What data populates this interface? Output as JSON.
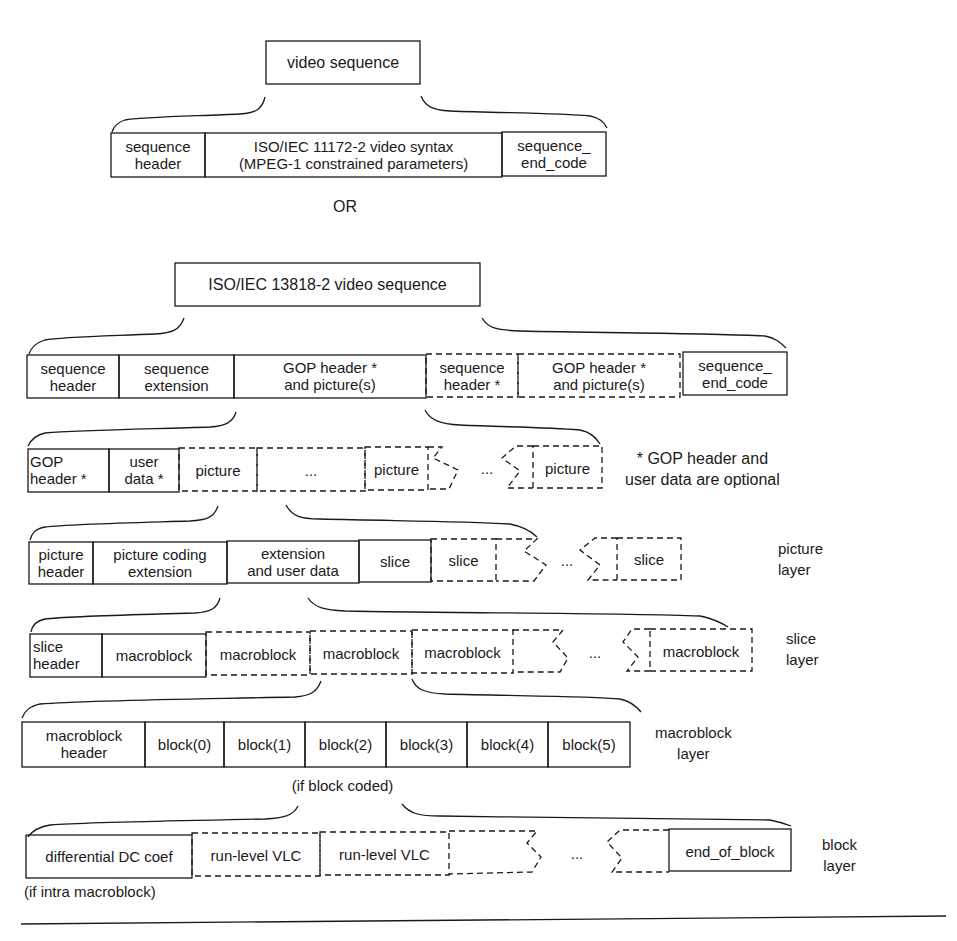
{
  "diagram": {
    "title_box_mpeg1": "video sequence",
    "mpeg1_row": {
      "cells": [
        {
          "label": [
            "sequence",
            "header"
          ],
          "style": "solid"
        },
        {
          "label": [
            "ISO/IEC 11172-2 video syntax",
            "(MPEG-1 constrained parameters)"
          ],
          "style": "solid"
        },
        {
          "label": [
            "sequence_",
            "end_code"
          ],
          "style": "solid"
        }
      ]
    },
    "or_label": "OR",
    "title_box_mpeg2": "ISO/IEC 13818-2 video sequence",
    "sequence_row": {
      "cells": [
        {
          "label": [
            "sequence",
            "header"
          ],
          "style": "solid"
        },
        {
          "label": [
            "sequence",
            "extension"
          ],
          "style": "solid"
        },
        {
          "label": [
            "GOP header *",
            "and picture(s)"
          ],
          "style": "solid"
        },
        {
          "label": [
            "sequence",
            "header *"
          ],
          "style": "dashed"
        },
        {
          "label": [
            "GOP header *",
            "and picture(s)"
          ],
          "style": "dashed"
        },
        {
          "label": [
            "sequence_",
            "end_code"
          ],
          "style": "solid"
        }
      ]
    },
    "gop_row": {
      "cells": [
        {
          "label": [
            "GOP",
            "header *"
          ],
          "style": "solid"
        },
        {
          "label": [
            "user",
            "data *"
          ],
          "style": "solid"
        },
        {
          "label": [
            "picture"
          ],
          "style": "dashed"
        },
        {
          "label": [
            "..."
          ],
          "style": "dashed"
        },
        {
          "label": [
            "picture"
          ],
          "style": "dashed"
        },
        {
          "label": [
            "..."
          ],
          "style": "gap"
        },
        {
          "label": [
            "picture"
          ],
          "style": "dashed"
        }
      ],
      "note": [
        "* GOP header and",
        "user data are optional"
      ]
    },
    "picture_row": {
      "cells": [
        {
          "label": [
            "picture",
            "header"
          ],
          "style": "solid"
        },
        {
          "label": [
            "picture coding",
            "extension"
          ],
          "style": "solid"
        },
        {
          "label": [
            "extension",
            "and user data"
          ],
          "style": "solid"
        },
        {
          "label": [
            "slice"
          ],
          "style": "solid"
        },
        {
          "label": [
            "slice"
          ],
          "style": "dashed"
        },
        {
          "label": [
            "..."
          ],
          "style": "gap"
        },
        {
          "label": [
            "slice"
          ],
          "style": "dashed"
        }
      ],
      "layer_label": [
        "picture",
        "layer"
      ]
    },
    "slice_row": {
      "cells": [
        {
          "label": [
            "slice",
            "header"
          ],
          "style": "solid"
        },
        {
          "label": [
            "macroblock"
          ],
          "style": "solid"
        },
        {
          "label": [
            "macroblock"
          ],
          "style": "dashed"
        },
        {
          "label": [
            "macroblock"
          ],
          "style": "dashed"
        },
        {
          "label": [
            "macroblock"
          ],
          "style": "dashed"
        },
        {
          "label": [
            "..."
          ],
          "style": "gap"
        },
        {
          "label": [
            "macroblock"
          ],
          "style": "dashed"
        }
      ],
      "layer_label": [
        "slice",
        "layer"
      ]
    },
    "macroblock_row": {
      "cells": [
        {
          "label": [
            "macroblock",
            "header"
          ],
          "style": "solid"
        },
        {
          "label": [
            "block(0)"
          ],
          "style": "solid"
        },
        {
          "label": [
            "block(1)"
          ],
          "style": "solid"
        },
        {
          "label": [
            "block(2)"
          ],
          "style": "solid"
        },
        {
          "label": [
            "block(3)"
          ],
          "style": "solid"
        },
        {
          "label": [
            "block(4)"
          ],
          "style": "solid"
        },
        {
          "label": [
            "block(5)"
          ],
          "style": "solid"
        }
      ],
      "layer_label": [
        "macroblock",
        "layer"
      ],
      "footnote": "(if block coded)"
    },
    "block_row": {
      "cells": [
        {
          "label": [
            "differential DC coef"
          ],
          "style": "solid"
        },
        {
          "label": [
            "run-level VLC"
          ],
          "style": "dashed"
        },
        {
          "label": [
            "run-level VLC"
          ],
          "style": "dashed"
        },
        {
          "label": [
            "..."
          ],
          "style": "gap"
        },
        {
          "label": [
            "end_of_block"
          ],
          "style": "solid"
        }
      ],
      "layer_label": [
        "block",
        "layer"
      ],
      "footnote": "(if intra macroblock)"
    },
    "colors": {
      "ink": "#1a1a1a",
      "background": "#ffffff"
    }
  }
}
